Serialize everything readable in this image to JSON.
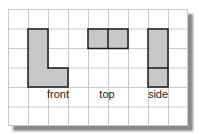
{
  "diagram": {
    "grid": {
      "columns": 9,
      "rows": 6
    },
    "views": [
      {
        "label": "front",
        "shape": "L",
        "cells": [
          [
            1,
            1
          ],
          [
            1,
            2
          ],
          [
            1,
            3
          ],
          [
            2,
            3
          ]
        ]
      },
      {
        "label": "top",
        "shape": "bar",
        "cells": [
          [
            4,
            1
          ],
          [
            5,
            1
          ]
        ]
      },
      {
        "label": "side",
        "shape": "column",
        "cells": [
          [
            7,
            1
          ],
          [
            7,
            2
          ],
          [
            7,
            3
          ]
        ]
      }
    ],
    "colors": {
      "fill": "#c8c8c8",
      "outline": "#1a1a1a",
      "grid": "#c8c8c8",
      "shadow": "#8a8a8a"
    }
  }
}
